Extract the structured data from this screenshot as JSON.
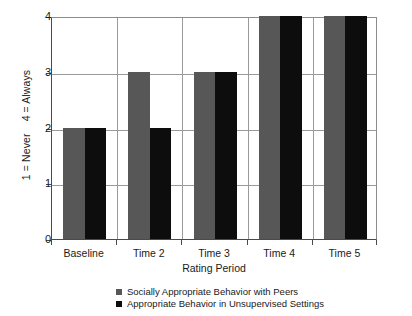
{
  "chart_data": {
    "type": "bar",
    "title": "",
    "subtitle": "",
    "xlabel": "Rating Period",
    "ylabel": "1 = Never    4 = Always",
    "categories": [
      "Baseline",
      "Time 2",
      "Time 3",
      "Time 4",
      "Time 5"
    ],
    "series": [
      {
        "name": "Socially Appropriate Behavior with Peers",
        "color": "#575757",
        "values": [
          2,
          3,
          3,
          4,
          4
        ]
      },
      {
        "name": "Appropriate Behavior in Unsupervised Settings",
        "color": "#0d0d0d",
        "values": [
          2,
          2,
          3,
          4,
          4
        ]
      }
    ],
    "ylim": [
      0,
      4
    ],
    "yticks": [
      0,
      1,
      2,
      3,
      4
    ],
    "ytick_labels": [
      "0",
      "1",
      "2",
      "3",
      "4"
    ],
    "grid": "horizontal-and-vertical",
    "legend_position": "bottom-center",
    "axis_color": "#4a4a4a",
    "grid_color": "#9a9a9a",
    "background": "#ffffff"
  }
}
